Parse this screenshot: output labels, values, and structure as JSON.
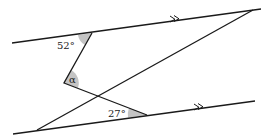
{
  "diagram": {
    "type": "geometry-parallel-lines-angles",
    "colors": {
      "line": "#1a1a1a",
      "shade": "#c4c4c4",
      "background": "#ffffff"
    },
    "angles": {
      "top": {
        "label": "52°",
        "value": 52
      },
      "middle": {
        "label": "α"
      },
      "bottom": {
        "label": "27°",
        "value": 27
      }
    },
    "parallel_marker": "double-arrow"
  }
}
